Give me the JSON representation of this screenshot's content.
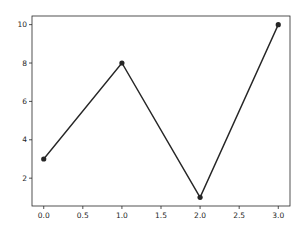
{
  "chart_data": {
    "type": "line",
    "title": "",
    "xlabel": "",
    "ylabel": "",
    "x": [
      0,
      1,
      2,
      3
    ],
    "series": [
      {
        "name": "",
        "values": [
          3,
          8,
          1,
          10
        ],
        "color": "#262626",
        "marker": "circle"
      }
    ],
    "xlim": [
      -0.15,
      3.15
    ],
    "ylim": [
      0.55,
      10.45
    ],
    "x_ticks": [
      0.0,
      0.5,
      1.0,
      1.5,
      2.0,
      2.5,
      3.0
    ],
    "x_tick_labels": [
      "0.0",
      "0.5",
      "1.0",
      "1.5",
      "2.0",
      "2.5",
      "3.0"
    ],
    "y_ticks": [
      2,
      4,
      6,
      8,
      10
    ],
    "y_tick_labels": [
      "2",
      "4",
      "6",
      "8",
      "10"
    ],
    "grid": false,
    "legend": null
  },
  "colors": {
    "line": "#262626",
    "axes": "#262626",
    "background": "#ffffff"
  }
}
